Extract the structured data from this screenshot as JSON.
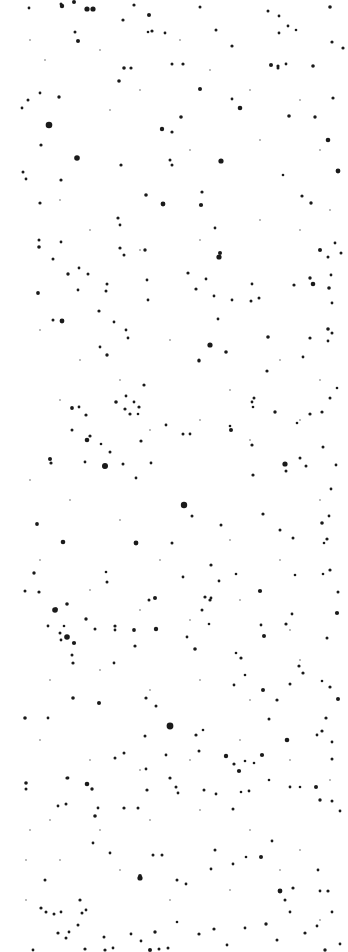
{
  "image": {
    "description": "Inverted star field: dark speckles on white background",
    "width": 348,
    "height": 952,
    "background": "#ffffff",
    "dot_color": "#1a1a1a",
    "faint_dot_color": "#9a9a9a"
  },
  "dots": [
    [
      62,
      6,
      2.2
    ],
    [
      61,
      4,
      1.5
    ],
    [
      87,
      9,
      2.6
    ],
    [
      93,
      9,
      2.6
    ],
    [
      74,
      2,
      2
    ],
    [
      29,
      8,
      1.4
    ],
    [
      134,
      5,
      1.6
    ],
    [
      149,
      15,
      2
    ],
    [
      123,
      20,
      1.6
    ],
    [
      152,
      31,
      1.6
    ],
    [
      75,
      32,
      1.5
    ],
    [
      78,
      41,
      2
    ],
    [
      200,
      7,
      1.5
    ],
    [
      216,
      30,
      1.5
    ],
    [
      232,
      46,
      1.6
    ],
    [
      268,
      11,
      1.5
    ],
    [
      279,
      16,
      1.4
    ],
    [
      288,
      26,
      1.4
    ],
    [
      279,
      33,
      1.4
    ],
    [
      296,
      30,
      1.3
    ],
    [
      286,
      64,
      1.4
    ],
    [
      278,
      68,
      1.5
    ],
    [
      313,
      66,
      1.8
    ],
    [
      330,
      7,
      1.8
    ],
    [
      343,
      48,
      1.6
    ],
    [
      49,
      125,
      3.3
    ],
    [
      77,
      158,
      2.8
    ],
    [
      40,
      93,
      1.4
    ],
    [
      22,
      108,
      1.4
    ],
    [
      28,
      100,
      1.5
    ],
    [
      41,
      145,
      1.6
    ],
    [
      59,
      97,
      1.7
    ],
    [
      124,
      68,
      1.8
    ],
    [
      131,
      68,
      1.6
    ],
    [
      119,
      81,
      1.8
    ],
    [
      162,
      129,
      2.2
    ],
    [
      181,
      117,
      1.8
    ],
    [
      172,
      132,
      1.6
    ],
    [
      170,
      160,
      1.5
    ],
    [
      200,
      89,
      2
    ],
    [
      221,
      161,
      2.6
    ],
    [
      240,
      108,
      2.3
    ],
    [
      232,
      99,
      1.4
    ],
    [
      183,
      64,
      1.6
    ],
    [
      172,
      64,
      1.5
    ],
    [
      148,
      32,
      1.3
    ],
    [
      165,
      33,
      1.4
    ],
    [
      271,
      65,
      2
    ],
    [
      278,
      66,
      1.6
    ],
    [
      289,
      116,
      1.8
    ],
    [
      315,
      117,
      1.7
    ],
    [
      338,
      171,
      2.4
    ],
    [
      328,
      140,
      2.3
    ],
    [
      333,
      98,
      1.6
    ],
    [
      332,
      42,
      1.6
    ],
    [
      302,
      196,
      1.6
    ],
    [
      311,
      203,
      1.7
    ],
    [
      283,
      175,
      1.3
    ],
    [
      121,
      165,
      1.6
    ],
    [
      146,
      195,
      1.8
    ],
    [
      163,
      204,
      2.4
    ],
    [
      201,
      205,
      2.1
    ],
    [
      202,
      192,
      1.6
    ],
    [
      172,
      165,
      1.5
    ],
    [
      215,
      228,
      1.4
    ],
    [
      23,
      172,
      1.5
    ],
    [
      26,
      179,
      1.4
    ],
    [
      39,
      240,
      1.5
    ],
    [
      40,
      203,
      1.6
    ],
    [
      61,
      180,
      1.6
    ],
    [
      118,
      218,
      1.6
    ],
    [
      120,
      225,
      1.4
    ],
    [
      39,
      247,
      1.8
    ],
    [
      53,
      259,
      1.5
    ],
    [
      68,
      274,
      1.7
    ],
    [
      88,
      274,
      1.5
    ],
    [
      61,
      242,
      1.4
    ],
    [
      79,
      268,
      1.4
    ],
    [
      78,
      290,
      1.4
    ],
    [
      38,
      293,
      1.9
    ],
    [
      106,
      291,
      1.5
    ],
    [
      107,
      284,
      1.5
    ],
    [
      53,
      320,
      1.5
    ],
    [
      62,
      321,
      2.4
    ],
    [
      99,
      311,
      1.6
    ],
    [
      120,
      248,
      1.6
    ],
    [
      124,
      255,
      1.5
    ],
    [
      145,
      250,
      1.7
    ],
    [
      147,
      280,
      1.4
    ],
    [
      148,
      300,
      1.4
    ],
    [
      188,
      273,
      1.6
    ],
    [
      196,
      289,
      1.6
    ],
    [
      206,
      279,
      1.4
    ],
    [
      219,
      257,
      2.6
    ],
    [
      220,
      253,
      2
    ],
    [
      214,
      296,
      1.4
    ],
    [
      218,
      319,
      1.4
    ],
    [
      210,
      345,
      2.6
    ],
    [
      226,
      352,
      1.8
    ],
    [
      199,
      361,
      1.6
    ],
    [
      232,
      300,
      1.4
    ],
    [
      251,
      301,
      1.5
    ],
    [
      259,
      298,
      1.5
    ],
    [
      268,
      337,
      1.8
    ],
    [
      252,
      284,
      1.4
    ],
    [
      294,
      285,
      1.6
    ],
    [
      313,
      284,
      2.3
    ],
    [
      310,
      278,
      1.7
    ],
    [
      329,
      288,
      1.8
    ],
    [
      335,
      243,
      1.4
    ],
    [
      341,
      253,
      1.5
    ],
    [
      320,
      250,
      2
    ],
    [
      328,
      329,
      1.8
    ],
    [
      332,
      333,
      1.5
    ],
    [
      328,
      341,
      1.4
    ],
    [
      328,
      257,
      1.5
    ],
    [
      332,
      303,
      1.4
    ],
    [
      331,
      275,
      1.4
    ],
    [
      310,
      338,
      1.6
    ],
    [
      303,
      357,
      1.4
    ],
    [
      199,
      360,
      1.6
    ],
    [
      107,
      355,
      1.7
    ],
    [
      100,
      347,
      1.4
    ],
    [
      144,
      385,
      1.6
    ],
    [
      114,
      322,
      1.4
    ],
    [
      126,
      330,
      1.4
    ],
    [
      128,
      338,
      1.4
    ],
    [
      116,
      402,
      1.8
    ],
    [
      139,
      407,
      1.6
    ],
    [
      134,
      402,
      1.4
    ],
    [
      254,
      398,
      1.5
    ],
    [
      252,
      402,
      1.4
    ],
    [
      267,
      371,
      1.6
    ],
    [
      253,
      407,
      1.3
    ],
    [
      275,
      412,
      1.7
    ],
    [
      297,
      423,
      1.3
    ],
    [
      310,
      414,
      1.6
    ],
    [
      322,
      412,
      1.6
    ],
    [
      330,
      398,
      1.5
    ],
    [
      337,
      388,
      1.3
    ],
    [
      72,
      408,
      1.9
    ],
    [
      86,
      415,
      1.6
    ],
    [
      79,
      407,
      1.4
    ],
    [
      72,
      430,
      1.5
    ],
    [
      90,
      436,
      1.6
    ],
    [
      87,
      440,
      2.3
    ],
    [
      101,
      444,
      1.3
    ],
    [
      125,
      409,
      1.6
    ],
    [
      126,
      396,
      1.4
    ],
    [
      130,
      414,
      1.6
    ],
    [
      138,
      414,
      1.3
    ],
    [
      141,
      441,
      1.6
    ],
    [
      110,
      452,
      1.5
    ],
    [
      104,
      467,
      1.4
    ],
    [
      50,
      459,
      2
    ],
    [
      51,
      463,
      1.6
    ],
    [
      85,
      462,
      1.4
    ],
    [
      105,
      466,
      3
    ],
    [
      123,
      464,
      1.5
    ],
    [
      136,
      478,
      1.4
    ],
    [
      151,
      463,
      1.4
    ],
    [
      166,
      425,
      1.4
    ],
    [
      183,
      434,
      1.5
    ],
    [
      190,
      434,
      1.4
    ],
    [
      231,
      430,
      2
    ],
    [
      230,
      426,
      1.3
    ],
    [
      252,
      445,
      1.6
    ],
    [
      253,
      475,
      1.6
    ],
    [
      285,
      464,
      2.6
    ],
    [
      286,
      471,
      1.5
    ],
    [
      300,
      458,
      1.5
    ],
    [
      306,
      466,
      1.5
    ],
    [
      323,
      447,
      1.5
    ],
    [
      336,
      465,
      1.4
    ],
    [
      331,
      489,
      1.4
    ],
    [
      184,
      505,
      3.2
    ],
    [
      192,
      516,
      1.5
    ],
    [
      37,
      524,
      1.9
    ],
    [
      63,
      542,
      2.3
    ],
    [
      136,
      543,
      2.4
    ],
    [
      172,
      543,
      1.5
    ],
    [
      221,
      525,
      1.5
    ],
    [
      263,
      514,
      1.6
    ],
    [
      280,
      530,
      1.5
    ],
    [
      293,
      538,
      1.5
    ],
    [
      322,
      523,
      1.8
    ],
    [
      329,
      516,
      1.4
    ],
    [
      327,
      539,
      1.6
    ],
    [
      324,
      543,
      1.3
    ],
    [
      34,
      573,
      1.7
    ],
    [
      25,
      591,
      1.5
    ],
    [
      39,
      592,
      1.6
    ],
    [
      56,
      609,
      1.7
    ],
    [
      67,
      604,
      1.8
    ],
    [
      55,
      610,
      2.8
    ],
    [
      73,
      663,
      1.6
    ],
    [
      86,
      619,
      1.7
    ],
    [
      95,
      629,
      1.5
    ],
    [
      106,
      572,
      1.3
    ],
    [
      107,
      582,
      1.5
    ],
    [
      155,
      598,
      2
    ],
    [
      149,
      600,
      1.5
    ],
    [
      134,
      630,
      1.9
    ],
    [
      135,
      646,
      1.6
    ],
    [
      156,
      629,
      2.2
    ],
    [
      183,
      577,
      1.4
    ],
    [
      205,
      597,
      1.6
    ],
    [
      210,
      600,
      1.6
    ],
    [
      202,
      610,
      1.5
    ],
    [
      209,
      624,
      1.3
    ],
    [
      219,
      581,
      1.4
    ],
    [
      236,
      574,
      1.3
    ],
    [
      211,
      565,
      1.6
    ],
    [
      211,
      598,
      1.4
    ],
    [
      241,
      658,
      1.6
    ],
    [
      260,
      591,
      2.1
    ],
    [
      264,
      636,
      2
    ],
    [
      261,
      625,
      1.4
    ],
    [
      286,
      624,
      1.6
    ],
    [
      292,
      614,
      1.4
    ],
    [
      295,
      575,
      1.3
    ],
    [
      323,
      574,
      1.3
    ],
    [
      330,
      570,
      1.6
    ],
    [
      327,
      638,
      1.5
    ],
    [
      337,
      613,
      2.1
    ],
    [
      338,
      592,
      1.5
    ],
    [
      67,
      637,
      2.8
    ],
    [
      74,
      643,
      2.1
    ],
    [
      72,
      655,
      1.5
    ],
    [
      60,
      633,
      1.5
    ],
    [
      48,
      626,
      1.4
    ],
    [
      61,
      640,
      1.4
    ],
    [
      64,
      626,
      1.3
    ],
    [
      73,
      698,
      1.8
    ],
    [
      115,
      626,
      1.6
    ],
    [
      115,
      630,
      1.4
    ],
    [
      114,
      663,
      1.4
    ],
    [
      99,
      703,
      2
    ],
    [
      146,
      698,
      1.6
    ],
    [
      156,
      706,
      1.5
    ],
    [
      187,
      637,
      1.4
    ],
    [
      195,
      649,
      1.8
    ],
    [
      236,
      653,
      1.3
    ],
    [
      245,
      675,
      1.3
    ],
    [
      234,
      685,
      1.4
    ],
    [
      263,
      690,
      2
    ],
    [
      277,
      700,
      1.6
    ],
    [
      269,
      719,
      1.5
    ],
    [
      299,
      666,
      1.6
    ],
    [
      290,
      684,
      1.5
    ],
    [
      303,
      673,
      1.6
    ],
    [
      322,
      681,
      1.3
    ],
    [
      330,
      687,
      1.6
    ],
    [
      326,
      718,
      1.6
    ],
    [
      338,
      699,
      2
    ],
    [
      25,
      718,
      1.8
    ],
    [
      48,
      718,
      1.4
    ],
    [
      170,
      726,
      3.4
    ],
    [
      145,
      736,
      1.5
    ],
    [
      166,
      755,
      1.4
    ],
    [
      196,
      735,
      1.6
    ],
    [
      203,
      730,
      1.3
    ],
    [
      199,
      751,
      1.5
    ],
    [
      226,
      756,
      2.2
    ],
    [
      234,
      764,
      1.6
    ],
    [
      239,
      771,
      2.1
    ],
    [
      245,
      761,
      1.3
    ],
    [
      262,
      755,
      2.1
    ],
    [
      287,
      740,
      2.3
    ],
    [
      254,
      763,
      1.3
    ],
    [
      317,
      735,
      1.4
    ],
    [
      322,
      731,
      1.6
    ],
    [
      332,
      759,
      1.5
    ],
    [
      332,
      742,
      1.4
    ],
    [
      26,
      783,
      1.8
    ],
    [
      26,
      789,
      1.5
    ],
    [
      67,
      778,
      1.6
    ],
    [
      68,
      778,
      1.4
    ],
    [
      87,
      784,
      2.3
    ],
    [
      92,
      789,
      1.7
    ],
    [
      124,
      753,
      1.5
    ],
    [
      115,
      758,
      1.5
    ],
    [
      146,
      769,
      1.4
    ],
    [
      147,
      790,
      1.6
    ],
    [
      170,
      778,
      1.6
    ],
    [
      176,
      787,
      1.5
    ],
    [
      178,
      793,
      1.4
    ],
    [
      204,
      790,
      1.5
    ],
    [
      216,
      794,
      1.4
    ],
    [
      233,
      809,
      1.5
    ],
    [
      241,
      792,
      1.3
    ],
    [
      249,
      791,
      1.4
    ],
    [
      269,
      780,
      1.3
    ],
    [
      290,
      787,
      1.4
    ],
    [
      300,
      787,
      1.3
    ],
    [
      316,
      787,
      2
    ],
    [
      320,
      800,
      1.7
    ],
    [
      332,
      801,
      1.5
    ],
    [
      340,
      811,
      1.4
    ],
    [
      66,
      804,
      1.5
    ],
    [
      58,
      806,
      1.4
    ],
    [
      95,
      816,
      1.8
    ],
    [
      98,
      808,
      1.4
    ],
    [
      93,
      843,
      1.4
    ],
    [
      110,
      853,
      1.4
    ],
    [
      124,
      808,
      1.6
    ],
    [
      138,
      808,
      1.5
    ],
    [
      140,
      878,
      2.6
    ],
    [
      140,
      876,
      1.9
    ],
    [
      153,
      855,
      1.5
    ],
    [
      162,
      855,
      1.5
    ],
    [
      177,
      880,
      1.5
    ],
    [
      186,
      884,
      1.4
    ],
    [
      211,
      869,
      1.4
    ],
    [
      215,
      850,
      1.5
    ],
    [
      233,
      864,
      1.4
    ],
    [
      246,
      857,
      1.3
    ],
    [
      261,
      857,
      2
    ],
    [
      272,
      841,
      1.4
    ],
    [
      280,
      891,
      2.4
    ],
    [
      285,
      900,
      1.5
    ],
    [
      293,
      888,
      1.6
    ],
    [
      290,
      912,
      1.4
    ],
    [
      318,
      870,
      1.4
    ],
    [
      320,
      891,
      1.4
    ],
    [
      328,
      891,
      1.6
    ],
    [
      332,
      912,
      1.4
    ],
    [
      45,
      880,
      1.5
    ],
    [
      41,
      908,
      1.6
    ],
    [
      46,
      912,
      1.5
    ],
    [
      54,
      914,
      1.5
    ],
    [
      61,
      912,
      1.4
    ],
    [
      80,
      900,
      1.6
    ],
    [
      82,
      913,
      1.5
    ],
    [
      86,
      910,
      1.4
    ],
    [
      78,
      925,
      1.5
    ],
    [
      69,
      932,
      1.4
    ],
    [
      58,
      933,
      1.6
    ],
    [
      66,
      938,
      1.5
    ],
    [
      104,
      937,
      1.5
    ],
    [
      105,
      950,
      1.6
    ],
    [
      113,
      948,
      1.4
    ],
    [
      131,
      934,
      1.4
    ],
    [
      141,
      941,
      1.4
    ],
    [
      155,
      932,
      1.7
    ],
    [
      159,
      949,
      1.5
    ],
    [
      150,
      950,
      2
    ],
    [
      168,
      948,
      1.5
    ],
    [
      177,
      922,
      1.3
    ],
    [
      199,
      934,
      1.6
    ],
    [
      214,
      929,
      1.6
    ],
    [
      227,
      945,
      1.4
    ],
    [
      245,
      928,
      1.4
    ],
    [
      266,
      924,
      1.7
    ],
    [
      277,
      940,
      1.5
    ],
    [
      305,
      933,
      1.6
    ],
    [
      317,
      926,
      1.4
    ],
    [
      325,
      950,
      1.7
    ],
    [
      340,
      944,
      1.4
    ],
    [
      33,
      950,
      1.4
    ],
    [
      85,
      949,
      1.6
    ]
  ],
  "faint_dots": [
    [
      30,
      40
    ],
    [
      45,
      60
    ],
    [
      100,
      50
    ],
    [
      140,
      90
    ],
    [
      180,
      40
    ],
    [
      210,
      70
    ],
    [
      250,
      90
    ],
    [
      300,
      100
    ],
    [
      320,
      150
    ],
    [
      260,
      140
    ],
    [
      190,
      150
    ],
    [
      110,
      110
    ],
    [
      60,
      200
    ],
    [
      90,
      230
    ],
    [
      140,
      250
    ],
    [
      200,
      240
    ],
    [
      260,
      220
    ],
    [
      300,
      230
    ],
    [
      330,
      210
    ],
    [
      40,
      330
    ],
    [
      80,
      360
    ],
    [
      120,
      380
    ],
    [
      170,
      340
    ],
    [
      230,
      390
    ],
    [
      280,
      360
    ],
    [
      320,
      380
    ],
    [
      60,
      400
    ],
    [
      150,
      430
    ],
    [
      200,
      420
    ],
    [
      250,
      440
    ],
    [
      300,
      420
    ],
    [
      30,
      480
    ],
    [
      70,
      500
    ],
    [
      120,
      520
    ],
    [
      160,
      560
    ],
    [
      230,
      540
    ],
    [
      280,
      560
    ],
    [
      320,
      500
    ],
    [
      40,
      560
    ],
    [
      90,
      590
    ],
    [
      140,
      610
    ],
    [
      190,
      620
    ],
    [
      240,
      600
    ],
    [
      290,
      630
    ],
    [
      50,
      680
    ],
    [
      100,
      670
    ],
    [
      150,
      690
    ],
    [
      200,
      680
    ],
    [
      250,
      700
    ],
    [
      300,
      660
    ],
    [
      40,
      740
    ],
    [
      90,
      760
    ],
    [
      140,
      770
    ],
    [
      190,
      760
    ],
    [
      240,
      740
    ],
    [
      290,
      760
    ],
    [
      330,
      780
    ],
    [
      50,
      820
    ],
    [
      100,
      830
    ],
    [
      150,
      820
    ],
    [
      200,
      810
    ],
    [
      250,
      830
    ],
    [
      300,
      850
    ],
    [
      60,
      860
    ],
    [
      120,
      870
    ],
    [
      170,
      900
    ],
    [
      230,
      890
    ],
    [
      280,
      870
    ],
    [
      320,
      920
    ],
    [
      30,
      830
    ],
    [
      26,
      860
    ],
    [
      26,
      900
    ]
  ]
}
